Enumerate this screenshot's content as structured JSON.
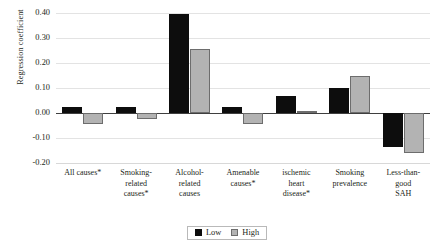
{
  "chart_data": {
    "type": "bar",
    "title": "",
    "xlabel": "",
    "ylabel": "Regression coefficient",
    "ylim": [
      -0.2,
      0.4
    ],
    "ytick_step": 0.1,
    "yticks": [
      "0.40",
      "0.30",
      "0.20",
      "0.10",
      "0.00",
      "-0.10",
      "-0.20"
    ],
    "ytick_values": [
      0.4,
      0.3,
      0.2,
      0.1,
      0.0,
      -0.1,
      -0.2
    ],
    "grid": true,
    "legend_position": "bottom-center",
    "categories": [
      "All causes*",
      "Smoking-related causes*",
      "Alcohol-related causes",
      "Amenable causes*",
      "ischemic heart disease*",
      "Smoking prevalence",
      "Less-than-good SAH"
    ],
    "category_lines": [
      [
        "All causes*"
      ],
      [
        "Smoking-",
        "related",
        "causes*"
      ],
      [
        "Alcohol-",
        "related",
        "causes"
      ],
      [
        "Amenable",
        "causes*"
      ],
      [
        "ischemic",
        "heart",
        "disease*"
      ],
      [
        "Smoking",
        "prevalence"
      ],
      [
        "Less-than-",
        "good",
        "SAH"
      ]
    ],
    "series": [
      {
        "name": "Low",
        "color": "#0d0d0d",
        "values": [
          0.025,
          0.025,
          0.395,
          0.025,
          0.07,
          0.1,
          -0.135
        ]
      },
      {
        "name": "High",
        "color": "#b3b3b3",
        "values": [
          -0.045,
          -0.025,
          0.255,
          -0.045,
          0.01,
          0.15,
          -0.16
        ]
      }
    ]
  },
  "legend": {
    "items": [
      {
        "label": "Low",
        "swatch": "low-swatch"
      },
      {
        "label": "High",
        "swatch": "high-swatch"
      }
    ]
  }
}
